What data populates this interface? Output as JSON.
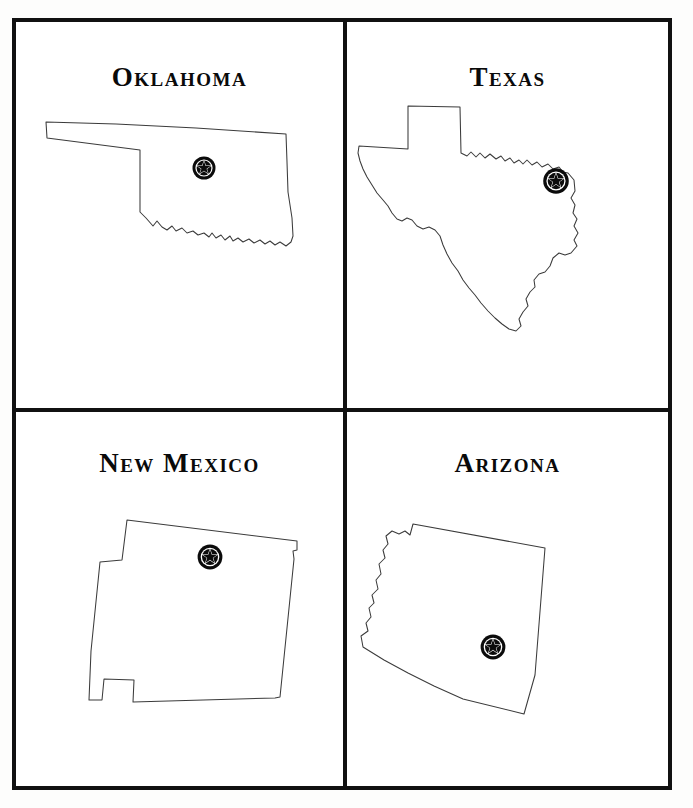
{
  "plate": {
    "kind": "four-panel-state-outline-plate",
    "frame_color": "#111111",
    "panel_background": "#ffffff",
    "outline_color": "#3b3b3b",
    "marker_color": "#0b0b0b",
    "marker_icon": "star-in-circle-badge-icon",
    "rows": 2,
    "columns": 2
  },
  "panels": [
    {
      "id": "oklahoma",
      "title": "Oklahoma",
      "position": "top-left",
      "marker": {
        "name": "capital-star-marker",
        "x": 188,
        "y": 146
      }
    },
    {
      "id": "texas",
      "title": "Texas",
      "position": "top-right",
      "marker": {
        "name": "capital-star-marker",
        "x": 554,
        "y": 239
      }
    },
    {
      "id": "new-mexico",
      "title": "New Mexico",
      "position": "bottom-left",
      "marker": {
        "name": "capital-star-marker",
        "x": 194,
        "y": 535
      }
    },
    {
      "id": "arizona",
      "title": "Arizona",
      "position": "bottom-right",
      "marker": {
        "name": "capital-star-marker",
        "x": 477,
        "y": 625
      }
    }
  ]
}
